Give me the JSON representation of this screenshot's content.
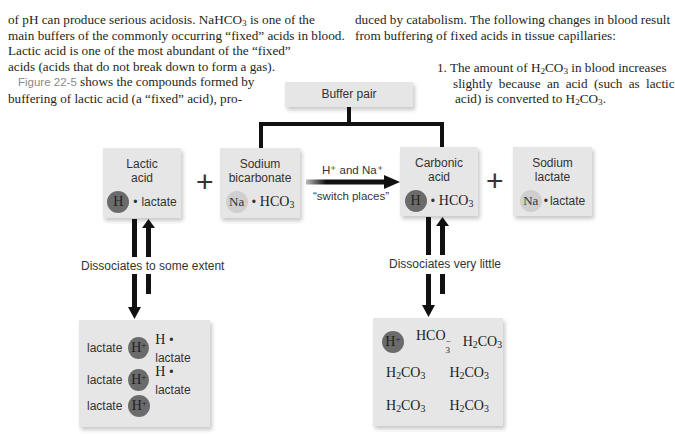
{
  "text": {
    "left": {
      "line1_pre": "of pH can produce serious acidosis. NaHCO",
      "line1_sub": "3",
      "line1_post": " is one of the",
      "line2": "main buffers of the commonly occurring “fixed” acids in blood.",
      "line3": "Lactic acid is one of the most abundant of the “fixed”",
      "line4": "acids (acids that do not break down to form a gas).",
      "figure_ref": "Figure 22-5",
      "line5_post": " shows the compounds formed by",
      "line6": "buffering of lactic acid (a “fixed” acid), pro-"
    },
    "right": {
      "line1": "duced by catabolism. The following changes in blood result",
      "line2": "from buffering of fixed acids in tissue capillaries:",
      "item1_num": "1.",
      "item1_line1_pre": "The amount of H",
      "item1_line1_sub1": "2",
      "item1_line1_mid": "CO",
      "item1_line1_sub2": "3",
      "item1_line1_post": " in blood increases",
      "item1_line2": "slightly because an acid (such as lactic",
      "item1_line3_pre": "acid) is converted to H",
      "item1_line3_sub1": "2",
      "item1_line3_mid": "CO",
      "item1_line3_sub2": "3",
      "item1_line3_post": "."
    }
  },
  "diagram": {
    "buffer_pair": "Buffer pair",
    "lactic_acid": {
      "title1": "Lactic",
      "title2": "acid",
      "circle": "H",
      "rest": "lactate"
    },
    "sodium_bicarbonate": {
      "title1": "Sodium",
      "title2": "bicarbonate",
      "circle": "Na",
      "rest": "HCO",
      "rest_sub": "3"
    },
    "arrow": {
      "top": "H⁺ and Na⁺",
      "bottom": "“switch places”"
    },
    "carbonic_acid": {
      "title1": "Carbonic",
      "title2": "acid",
      "circle": "H",
      "rest": "HCO",
      "rest_sub": "3"
    },
    "sodium_lactate": {
      "title1": "Sodium",
      "title2": "lactate",
      "circle": "Na",
      "rest": "lactate"
    },
    "plus": "+",
    "dissociates_left": "Dissociates to some extent",
    "dissociates_right": "Dissociates very little",
    "lactic_products": [
      {
        "anion": "lactate",
        "ion": "H",
        "ion_sup": "+",
        "molecule_h": "H",
        "molecule_rest": "lactate"
      },
      {
        "anion": "lactate",
        "ion": "H",
        "ion_sup": "+",
        "molecule_h": "H",
        "molecule_rest": "lactate"
      },
      {
        "anion": "lactate",
        "ion": "H",
        "ion_sup": "+"
      }
    ],
    "carbonic_products": {
      "ion": "H",
      "ion_sup": "+",
      "bicarb": "HCO",
      "bicarb_sub": "3",
      "bicarb_sup": "−",
      "molecule": "H",
      "molecule_sub1": "2",
      "molecule_mid": "CO",
      "molecule_sub2": "3"
    }
  },
  "colors": {
    "box": "#e6e6e6",
    "h_circle": "#6b6b6b",
    "na_circle": "#cfcfcf",
    "lines": "#111111",
    "figure_ref": "#8a8a8a"
  }
}
